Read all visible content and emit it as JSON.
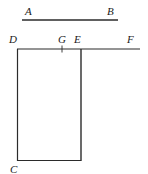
{
  "figure": {
    "kind": "geometry-diagram",
    "width": 148,
    "height": 174,
    "background_color": "#ffffff",
    "stroke_color": "#2b2b2b",
    "label_color": "#1a1a1a",
    "labels": {
      "a": "A",
      "b": "B",
      "c": "C",
      "d": "D",
      "e": "E",
      "f": "F",
      "g": "G"
    },
    "label_positions": {
      "a": {
        "x": 25,
        "y": 6
      },
      "b": {
        "x": 107,
        "y": 6
      },
      "c": {
        "x": 10,
        "y": 164
      },
      "d": {
        "x": 9,
        "y": 34
      },
      "e": {
        "x": 74,
        "y": 34
      },
      "f": {
        "x": 127,
        "y": 34
      },
      "g": {
        "x": 58,
        "y": 34
      }
    },
    "segments": [
      {
        "name": "segment-ab",
        "x1": 22,
        "y1": 20,
        "x2": 118,
        "y2": 20
      },
      {
        "name": "segment-df",
        "x1": 17,
        "y1": 49,
        "x2": 140,
        "y2": 49
      },
      {
        "name": "segment-dc-left-side",
        "x1": 17,
        "y1": 49,
        "x2": 17,
        "y2": 161
      },
      {
        "name": "segment-e-right-side",
        "x1": 81,
        "y1": 49,
        "x2": 81,
        "y2": 161
      },
      {
        "name": "segment-bottom",
        "x1": 17,
        "y1": 161,
        "x2": 81,
        "y2": 161
      },
      {
        "name": "tick-mark-g",
        "x1": 62,
        "y1": 46,
        "x2": 62,
        "y2": 52
      }
    ]
  }
}
